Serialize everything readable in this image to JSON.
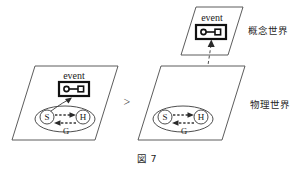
{
  "figure": {
    "caption": "図 7",
    "comparison_symbol": ">"
  },
  "planes": {
    "conceptual": {
      "label": "概念世界",
      "event_label": "event",
      "icon": "circle-line-square-icon"
    },
    "physical_left": {
      "label": "",
      "event_label": "event",
      "icon": "circle-line-square-icon",
      "nodes": {
        "speaker": "S",
        "hearer": "H",
        "ground": "G"
      }
    },
    "physical_right": {
      "label": "物理世界",
      "nodes": {
        "speaker": "S",
        "hearer": "H",
        "ground": "G"
      }
    }
  }
}
